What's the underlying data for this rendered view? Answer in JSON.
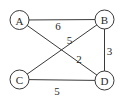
{
  "diagram": {
    "type": "weighted-undirected-graph",
    "colors": {
      "background": "#ffffff",
      "stroke": "#3a3a3a",
      "text": "#2a2a2a"
    },
    "node_radius": 9.5,
    "nodes": [
      {
        "id": "A",
        "label": "A",
        "x": 19.5,
        "y": 20
      },
      {
        "id": "B",
        "label": "B",
        "x": 104.5,
        "y": 19.5
      },
      {
        "id": "C",
        "label": "C",
        "x": 19.5,
        "y": 79.5
      },
      {
        "id": "D",
        "label": "D",
        "x": 104.5,
        "y": 80.5
      }
    ],
    "edges": [
      {
        "from": "A",
        "to": "B",
        "weight": "6",
        "label_x": 58,
        "label_y": 26
      },
      {
        "from": "C",
        "to": "B",
        "weight": "5",
        "label_x": 69.5,
        "label_y": 40
      },
      {
        "from": "A",
        "to": "D",
        "weight": "2",
        "label_x": 79,
        "label_y": 59
      },
      {
        "from": "B",
        "to": "D",
        "weight": "3",
        "label_x": 109.5,
        "label_y": 51
      },
      {
        "from": "C",
        "to": "D",
        "weight": "5",
        "label_x": 57,
        "label_y": 91
      }
    ]
  }
}
